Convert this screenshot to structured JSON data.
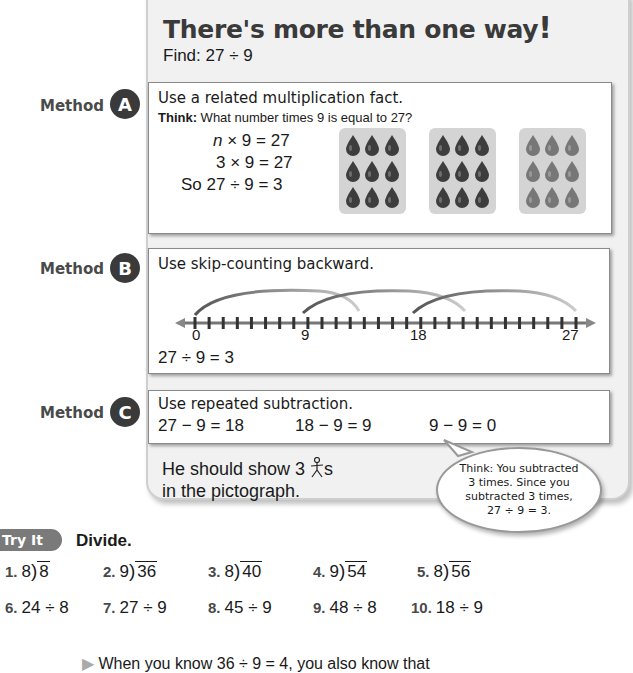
{
  "header": {
    "title": "There's more than one way",
    "title_bang": "!",
    "find_label": "Find: 27 ÷ 9"
  },
  "methods": [
    {
      "label": "Method",
      "badge": "A",
      "heading": "Use a related multiplication fact.",
      "think_bold": "Think:",
      "think_text": " What number times 9 is equal to 27?",
      "lines": [
        "n × 9 = 27",
        "3 × 9 = 27",
        "So 27 ÷ 9 = 3"
      ],
      "groups": 3,
      "drops_per_group": 9,
      "drop_colors": [
        "#3d3d3d",
        "#3d3d3d",
        "#777777"
      ]
    },
    {
      "label": "Method",
      "badge": "B",
      "heading": "Use skip-counting backward.",
      "number_line": {
        "min": 0,
        "max": 27,
        "labels": [
          "0",
          "9",
          "18",
          "27"
        ],
        "jumps": 3
      },
      "result": "27 ÷ 9 = 3"
    },
    {
      "label": "Method",
      "badge": "C",
      "heading": "Use repeated subtraction.",
      "steps": [
        "27 − 9 = 18",
        "18 − 9 = 9",
        "9 − 9 = 0"
      ]
    }
  ],
  "conclusion": {
    "line1_pre": "He should show 3 ",
    "line1_post": "s",
    "line2": "in the pictograph.",
    "icon": "stick-figure-icon"
  },
  "bubble": {
    "lines": [
      "Think:  You subtracted",
      "3 times. Since you",
      "subtracted 3 times,",
      "27 ÷ 9 = 3."
    ]
  },
  "try_it": {
    "badge": "Try It",
    "instruction": "Divide.",
    "row1": [
      {
        "num": "1.",
        "divisor": "8",
        "dividend": "8"
      },
      {
        "num": "2.",
        "divisor": "9",
        "dividend": "36"
      },
      {
        "num": "3.",
        "divisor": "8",
        "dividend": "40"
      },
      {
        "num": "4.",
        "divisor": "9",
        "dividend": "54"
      },
      {
        "num": "5.",
        "divisor": "8",
        "dividend": "56"
      }
    ],
    "row2": [
      {
        "num": "6.",
        "expr": "24 ÷ 8"
      },
      {
        "num": "7.",
        "expr": "27 ÷ 9"
      },
      {
        "num": "8.",
        "expr": "45 ÷ 9"
      },
      {
        "num": "9.",
        "expr": "48 ÷ 8"
      },
      {
        "num": "10.",
        "expr": "18 ÷ 9"
      }
    ]
  },
  "cutoff_text": "When you know 36 ÷ 9 = 4, you also know that"
}
